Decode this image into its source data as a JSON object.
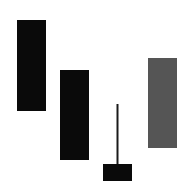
{
  "chart_data": {
    "type": "candlestick",
    "title": "",
    "xlabel": "",
    "ylabel": "",
    "grid": false,
    "axes_visible": false,
    "ylim": [
      0,
      192
    ],
    "colors": {
      "bearish": "#0a0a0a",
      "bullish": "#555555",
      "wick": "#1a1a1a"
    },
    "candles": [
      {
        "name": "candle-1",
        "open": 172,
        "close": 81,
        "high": 172,
        "low": 81,
        "direction": "bearish"
      },
      {
        "name": "candle-2",
        "open": 122,
        "close": 32,
        "high": 122,
        "low": 32,
        "direction": "bearish"
      },
      {
        "name": "candle-3",
        "open": 28,
        "close": 11,
        "high": 88,
        "low": 11,
        "direction": "bearish"
      },
      {
        "name": "candle-4",
        "open": 44,
        "close": 134,
        "high": 134,
        "low": 44,
        "direction": "bullish"
      }
    ]
  }
}
